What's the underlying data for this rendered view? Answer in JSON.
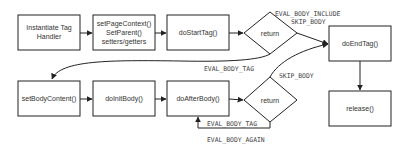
{
  "diagram": {
    "colors": {
      "stroke": "#222222",
      "text": "#333333",
      "background": "#ffffff"
    },
    "nodes": {
      "instantiate": {
        "type": "process",
        "lines": [
          "Instantiate Tag",
          "Handler"
        ]
      },
      "set_page_context": {
        "type": "process",
        "lines": [
          "setPageContext()",
          "SetParent()",
          "setters/getters"
        ]
      },
      "do_start_tag": {
        "type": "process",
        "lines": [
          "doStartTag()"
        ]
      },
      "return_start": {
        "type": "decision",
        "lines": [
          "return"
        ]
      },
      "do_end_tag": {
        "type": "process",
        "lines": [
          "doEndTag()"
        ]
      },
      "release": {
        "type": "process",
        "lines": [
          "release()"
        ]
      },
      "set_body_content": {
        "type": "process",
        "lines": [
          "setBodyContent()"
        ]
      },
      "do_init_body": {
        "type": "process",
        "lines": [
          "doInitBody()"
        ]
      },
      "do_after_body": {
        "type": "process",
        "lines": [
          "doAfterBody()"
        ]
      },
      "return_after": {
        "type": "decision",
        "lines": [
          "return"
        ]
      }
    },
    "edge_labels": {
      "eval_body_include": "EVAL_BODY_INCLUDE",
      "skip_body_top": "SKIP_BODY",
      "eval_body_tag_top": "EVAL_BODY_TAG",
      "skip_body_bottom": "SKIP_BODY",
      "eval_body_tag_loop": "EVAL_BODY_TAG",
      "eval_body_again": "EVAL_BODY_AGAIN"
    }
  }
}
